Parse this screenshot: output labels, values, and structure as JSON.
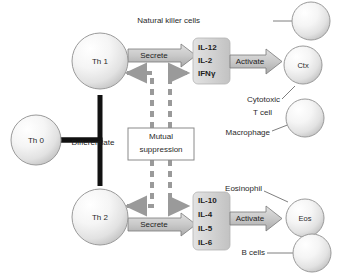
{
  "diagram": {
    "colors": {
      "sphere_stroke": "#8d8d8d",
      "block_arrow_fill": "#c9c9c9",
      "block_arrow_stroke": "#7a7a7a",
      "dashed_arrow": "#9a9a9a",
      "thick_arrow": "#111111",
      "cytokine_box_fill": "#d8d8d8",
      "text": "#2a2a2a",
      "background": "#ffffff"
    },
    "nodes": {
      "th0": "Th 0",
      "th1": "Th 1",
      "th2": "Th 2",
      "ctx": "Ctx",
      "eos": "Eos",
      "nk_cell": "",
      "macrophage_cell": "",
      "bcell": ""
    },
    "edge_labels": {
      "differentiate": "Differentiate",
      "secrete_th1": "Secrete",
      "secrete_th2": "Secrete",
      "activate_th1": "Activate",
      "activate_th2": "Activate"
    },
    "suppression_box": {
      "line1": "Mutual",
      "line2": "suppression"
    },
    "cytokines_th1": [
      "IL-12",
      "IL-2",
      "IFNγ"
    ],
    "cytokines_th2": [
      "IL-10",
      "IL-4",
      "IL-5",
      "IL-6"
    ],
    "target_labels": {
      "natural_killer": "Natural killer cells",
      "cytotoxic_line1": "Cytotoxic",
      "cytotoxic_line2": "T cell",
      "macrophage": "Macrophage",
      "eosinophil": "Eosinophil",
      "b_cells": "B cells"
    }
  }
}
